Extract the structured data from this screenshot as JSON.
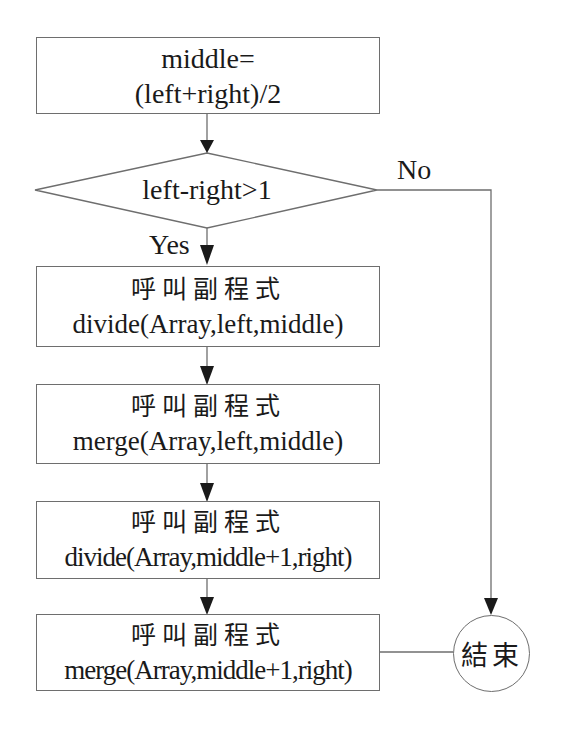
{
  "diagram": {
    "type": "flowchart",
    "start_box": {
      "line1": "middle=",
      "line2": "(left+right)/2"
    },
    "decision": {
      "text": "left-right>1",
      "yes_label": "Yes",
      "no_label": "No"
    },
    "steps": [
      {
        "caption": "呼叫副程式",
        "call": "divide(Array,left,middle)"
      },
      {
        "caption": "呼叫副程式",
        "call": "merge(Array,left,middle)"
      },
      {
        "caption": "呼叫副程式",
        "call": "divide(Array,middle+1,right)"
      },
      {
        "caption": "呼叫副程式",
        "call": "merge(Array,middle+1,right)"
      }
    ],
    "end_node": {
      "text": "結束"
    },
    "colors": {
      "line": "#6e6e6e",
      "arrow": "#1a1a1a",
      "text": "#1a1a1a",
      "background": "#ffffff"
    }
  }
}
